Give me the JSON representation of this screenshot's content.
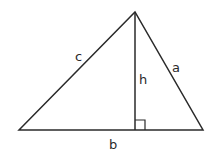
{
  "diagram": {
    "stroke_color": "#2a2a2a",
    "background": "#ffffff",
    "vertices": {
      "left": [
        19,
        130
      ],
      "apex": [
        135,
        12
      ],
      "right": [
        203,
        130
      ],
      "foot": [
        135,
        130
      ]
    },
    "labels": {
      "c": "c",
      "a": "a",
      "h": "h",
      "b": "b"
    },
    "right_angle_marker": true
  }
}
